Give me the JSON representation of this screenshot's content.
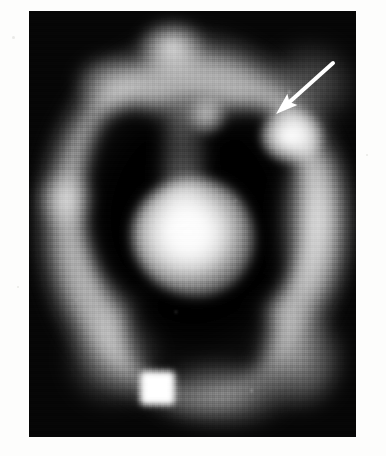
{
  "figure": {
    "kind": "grayscale-nuclear-medicine-scan",
    "modality_appearance": "scintigraphy / SPECT transaxial slice",
    "page_background": "#fdfdfc",
    "frame": {
      "x": 29,
      "y": 11,
      "width": 327,
      "height": 426,
      "background": "#030303"
    },
    "colors": {
      "background": "#030303",
      "page": "#fdfdfc",
      "hot_white": "#ffffff",
      "ring_gray": "#b8b8b8",
      "cold_black": "#000000",
      "annotation": "#ffffff"
    }
  },
  "annotation": {
    "arrow": {
      "label": "arrow pointing to focal uptake",
      "tail_x": 333,
      "tail_y": 63,
      "tip_x": 276,
      "tip_y": 114,
      "color": "#ffffff",
      "shaft_width": 4,
      "head_length": 22,
      "head_width": 15
    }
  },
  "features": [
    {
      "name": "outer-uptake-ring",
      "label": "Outer ring of tracer uptake",
      "cx": 163,
      "cy": 212,
      "rx": 170,
      "ry": 206,
      "intensity": "moderate-high"
    },
    {
      "name": "central-hot-focus",
      "label": "Central intense focus",
      "cx": 164,
      "cy": 226,
      "rx": 61,
      "ry": 59,
      "intensity": "maximum"
    },
    {
      "name": "arrow-indicated-focus",
      "label": "Focal hot spot indicated by arrow",
      "cx": 263,
      "cy": 125,
      "rx": 31,
      "ry": 27,
      "intensity": "high"
    },
    {
      "name": "reference-marker",
      "label": "Square reference point source marker",
      "cx": 128,
      "cy": 377,
      "rx": 17,
      "ry": 17,
      "intensity": "maximum"
    },
    {
      "name": "apical-node",
      "label": "Small superior nodular focus",
      "cx": 177,
      "cy": 104,
      "rx": 20,
      "ry": 20,
      "intensity": "low-moderate"
    },
    {
      "name": "ring-hot-top",
      "label": "Superior ring hot spot",
      "cx": 143,
      "cy": 36,
      "rx": 33,
      "ry": 26,
      "intensity": "high"
    },
    {
      "name": "ring-hot-left",
      "label": "Left lateral ring hot spot",
      "cx": 36,
      "cy": 188,
      "rx": 28,
      "ry": 28,
      "intensity": "moderate"
    },
    {
      "name": "ring-hot-right",
      "label": "Right lateral ring band",
      "cx": 287,
      "cy": 215,
      "rx": 32,
      "ry": 75,
      "intensity": "moderate-high"
    },
    {
      "name": "cold-cavity-left",
      "label": "Left photopenic cavity",
      "cx": 102,
      "cy": 184,
      "rx": 48,
      "ry": 92,
      "intensity": "none"
    },
    {
      "name": "cold-cavity-right",
      "label": "Right photopenic cavity",
      "cx": 222,
      "cy": 196,
      "rx": 52,
      "ry": 100,
      "intensity": "none"
    },
    {
      "name": "cold-cavity-lower",
      "label": "Inferior photopenic cavity",
      "cx": 171,
      "cy": 326,
      "rx": 75,
      "ry": 60,
      "intensity": "none"
    }
  ],
  "field_specks": [
    {
      "x": 259,
      "y": 79,
      "d": 3
    },
    {
      "x": 206,
      "y": 188,
      "d": 2
    },
    {
      "x": 146,
      "y": 300,
      "d": 2
    },
    {
      "x": 221,
      "y": 378,
      "d": 3
    },
    {
      "x": 46,
      "y": 288,
      "d": 2
    }
  ],
  "page_specks": [
    {
      "x": 12,
      "y": 36,
      "d": 3
    },
    {
      "x": 17,
      "y": 286,
      "d": 2
    },
    {
      "x": 366,
      "y": 154,
      "d": 2
    }
  ]
}
